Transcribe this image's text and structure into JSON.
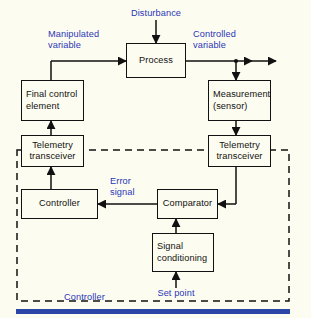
{
  "figure": {
    "background_color": "#fdfcf0",
    "line_color": "#111111",
    "label_color": "#2a36b8",
    "accent_bar_color": "#2a46a8"
  },
  "blocks": [
    {
      "id": "process",
      "text": "Process"
    },
    {
      "id": "final_control",
      "text": "Final control\nelement"
    },
    {
      "id": "measurement",
      "text": "Measurement\n(sensor)"
    },
    {
      "id": "telemetry_left",
      "text": "Telemetry\ntransceiver"
    },
    {
      "id": "telemetry_right",
      "text": "Telemetry\ntransceiver"
    },
    {
      "id": "controller",
      "text": "Controller"
    },
    {
      "id": "comparator",
      "text": "Comparator"
    },
    {
      "id": "signal_conditioning",
      "text": "Signal\nconditioning"
    }
  ],
  "labels": {
    "disturbance": "Disturbance",
    "manipulated_variable": "Manipulated\nvariable",
    "controlled_variable": "Controlled\nvariable",
    "error_signal": "Error\nsignal",
    "set_point": "Set point",
    "controller_group": "Controller"
  }
}
